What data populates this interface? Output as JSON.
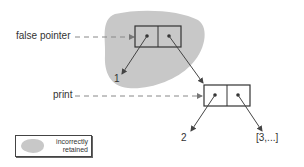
{
  "diagram": {
    "labels": {
      "false_pointer": "false pointer",
      "print": "print",
      "value_1": "1",
      "value_2": "2",
      "value_3": "[3,...]"
    },
    "legend": {
      "line1": "incorrectly",
      "line2": "retained"
    },
    "colors": {
      "region_fill": "#c8c8c8",
      "stroke": "#444444",
      "dashed_arrow": "#888888"
    },
    "nodes": [
      {
        "id": "cons-cell-1",
        "head": "1",
        "tail": "cons-cell-2",
        "retained": true
      },
      {
        "id": "cons-cell-2",
        "head": "2",
        "tail": "[3,...]",
        "retained": false
      }
    ]
  }
}
